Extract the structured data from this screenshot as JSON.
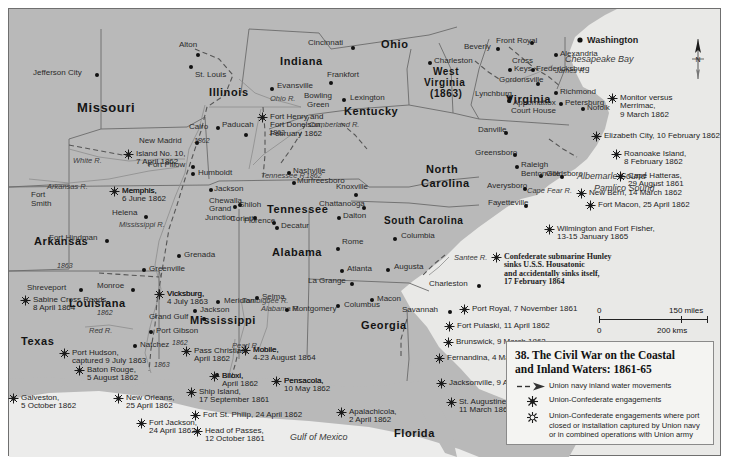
{
  "legend": {
    "title_line1": "38. The Civil War on the Coastal",
    "title_line2": "and Inland Waters: 1861-65",
    "items": [
      {
        "icon": "dashed-arrow-icon",
        "text": "Union navy inland water movements"
      },
      {
        "icon": "starburst-dark-icon",
        "text": "Union-Confederate engagements"
      },
      {
        "icon": "starburst-light-icon",
        "text": "Union-Confederate engagements where port closed or installation captured by Union navy or in combined operations with Union army"
      }
    ]
  },
  "scale": {
    "miles_zero": "0",
    "miles_max": "150 miles",
    "kms_zero": "0",
    "kms_max": "200 kms"
  },
  "compass": {
    "label": "N"
  },
  "states": [
    {
      "name": "Missouri",
      "x": 68,
      "y": 92,
      "size": "s13"
    },
    {
      "name": "Illinois",
      "x": 200,
      "y": 78,
      "size": "s11"
    },
    {
      "name": "Indiana",
      "x": 271,
      "y": 47,
      "size": "s11"
    },
    {
      "name": "Ohio",
      "x": 372,
      "y": 30,
      "size": "s11"
    },
    {
      "name": "Kentucky",
      "x": 335,
      "y": 97,
      "size": "s11"
    },
    {
      "name": "West",
      "x": 424,
      "y": 58,
      "size": "s10"
    },
    {
      "name": "Virginia",
      "x": 415,
      "y": 69,
      "size": "s10"
    },
    {
      "name": "(1863)",
      "x": 421,
      "y": 80,
      "size": "s10"
    },
    {
      "name": "Virginia",
      "x": 497,
      "y": 85,
      "size": "s11"
    },
    {
      "name": "Arkansas",
      "x": 25,
      "y": 227,
      "size": "s11"
    },
    {
      "name": "Tennessee",
      "x": 258,
      "y": 195,
      "size": "s11"
    },
    {
      "name": "North",
      "x": 417,
      "y": 155,
      "size": "s11"
    },
    {
      "name": "Carolina",
      "x": 412,
      "y": 169,
      "size": "s11"
    },
    {
      "name": "South Carolina",
      "x": 375,
      "y": 207,
      "size": "s10"
    },
    {
      "name": "Alabama",
      "x": 263,
      "y": 238,
      "size": "s11"
    },
    {
      "name": "Mississippi",
      "x": 181,
      "y": 306,
      "size": "s11"
    },
    {
      "name": "Louisiana",
      "x": 60,
      "y": 289,
      "size": "s11"
    },
    {
      "name": "Texas",
      "x": 12,
      "y": 327,
      "size": "s11"
    },
    {
      "name": "Georgia",
      "x": 352,
      "y": 311,
      "size": "s11"
    },
    {
      "name": "Florida",
      "x": 385,
      "y": 419,
      "size": "s11"
    }
  ],
  "waters": [
    {
      "name": "Gulf of Mexico",
      "x": 281,
      "y": 424
    },
    {
      "name": "Chesapeake Bay",
      "x": 556,
      "y": 46
    },
    {
      "name": "Albemarle Sound",
      "x": 568,
      "y": 163
    },
    {
      "name": "Pamlico Sound",
      "x": 585,
      "y": 175
    }
  ],
  "rivers": [
    {
      "name": "White R.",
      "x": 64,
      "y": 148
    },
    {
      "name": "Arkansas R.",
      "x": 38,
      "y": 174
    },
    {
      "name": "Mississippi R.",
      "x": 110,
      "y": 212
    },
    {
      "name": "Tennessee R.",
      "x": 252,
      "y": 163
    },
    {
      "name": "Cumberland R.",
      "x": 300,
      "y": 112
    },
    {
      "name": "Ohio R.",
      "x": 261,
      "y": 86
    },
    {
      "name": "James R.",
      "x": 546,
      "y": 58
    },
    {
      "name": "Santee R.",
      "x": 445,
      "y": 245
    },
    {
      "name": "Cape Fear R.",
      "x": 518,
      "y": 178
    },
    {
      "name": "Red R.",
      "x": 80,
      "y": 318
    },
    {
      "name": "Pearl R.",
      "x": 223,
      "y": 333
    },
    {
      "name": "Tombigbee R.",
      "x": 233,
      "y": 288
    },
    {
      "name": "Alabama R.",
      "x": 252,
      "y": 296
    }
  ],
  "year_marks": [
    {
      "name": "1862",
      "x": 185,
      "y": 128
    },
    {
      "name": "1862",
      "x": 260,
      "y": 120
    },
    {
      "name": "1862",
      "x": 297,
      "y": 163
    },
    {
      "name": "1863",
      "x": 48,
      "y": 253
    },
    {
      "name": "1862",
      "x": 163,
      "y": 330
    },
    {
      "name": "1862",
      "x": 88,
      "y": 300
    },
    {
      "name": "1863",
      "x": 145,
      "y": 352
    }
  ],
  "cities": [
    {
      "name": "Jefferson City",
      "x": 24,
      "y": 60,
      "dx": 62,
      "dy": 4
    },
    {
      "name": "Alton",
      "x": 170,
      "y": 32,
      "dx": 17,
      "dy": 12
    },
    {
      "name": "St. Louis",
      "x": 186,
      "y": 62,
      "dx": -6,
      "dy": -6
    },
    {
      "name": "Cairo",
      "x": 180,
      "y": 114,
      "dx": 27,
      "dy": 3
    },
    {
      "name": "Paducah",
      "x": 213,
      "y": 112,
      "dx": 22,
      "dy": 12
    },
    {
      "name": "Cincinnati",
      "x": 299,
      "y": 30,
      "dx": 43,
      "dy": 7
    },
    {
      "name": "Evansville",
      "x": 268,
      "y": 73,
      "dx": -7,
      "dy": 5
    },
    {
      "name": "Frankfort",
      "x": 318,
      "y": 62,
      "dx": 2,
      "dy": 10
    },
    {
      "name": "Lexington",
      "x": 341,
      "y": 85,
      "dx": -8,
      "dy": 4
    },
    {
      "name": "Bowling",
      "x": 295,
      "y": 83,
      "dx": 0,
      "dy": 0
    },
    {
      "name": "Green",
      "x": 298,
      "y": 92,
      "dx": 0,
      "dy": 0
    },
    {
      "name": "Charleston",
      "x": 425,
      "y": 48,
      "dx": -6,
      "dy": 4
    },
    {
      "name": "Beverly",
      "x": 455,
      "y": 34,
      "dx": 32,
      "dy": 4
    },
    {
      "name": "Front Royal",
      "x": 487,
      "y": 28,
      "dx": 34,
      "dy": 4
    },
    {
      "name": "Alexandria",
      "x": 551,
      "y": 41,
      "dx": -6,
      "dy": 3
    },
    {
      "name": "Cross",
      "x": 503,
      "y": 48,
      "dx": 0,
      "dy": 0
    },
    {
      "name": "Keys",
      "x": 505,
      "y": 56,
      "dx": -6,
      "dy": 3
    },
    {
      "name": "Fredericksburg",
      "x": 527,
      "y": 56,
      "dx": -5,
      "dy": 3
    },
    {
      "name": "Gordonsville",
      "x": 490,
      "y": 67,
      "dx": 37,
      "dy": 6
    },
    {
      "name": "Richmond",
      "x": 551,
      "y": 79,
      "dx": -6,
      "dy": 3
    },
    {
      "name": "Lynchburg",
      "x": 466,
      "y": 81,
      "dx": 33,
      "dy": 6
    },
    {
      "name": "Petersburg",
      "x": 556,
      "y": 90,
      "dx": -6,
      "dy": 3
    },
    {
      "name": "Appomattox",
      "x": 504,
      "y": 90,
      "dx": -6,
      "dy": 0
    },
    {
      "name": "Court House",
      "x": 502,
      "y": 98,
      "dx": 0,
      "dy": 0
    },
    {
      "name": "Nofolk",
      "x": 578,
      "y": 95,
      "dx": -6,
      "dy": 3
    },
    {
      "name": "Danville",
      "x": 469,
      "y": 117,
      "dx": 26,
      "dy": 5
    },
    {
      "name": "Greensboro",
      "x": 466,
      "y": 140,
      "dx": 38,
      "dy": 4
    },
    {
      "name": "Raleigh",
      "x": 512,
      "y": 152,
      "dx": -6,
      "dy": 4
    },
    {
      "name": "Goldsboro",
      "x": 537,
      "y": 161,
      "dx": -7,
      "dy": 4
    },
    {
      "name": "Bentonville",
      "x": 512,
      "y": 161,
      "dx": 39,
      "dy": 5
    },
    {
      "name": "Averysboro",
      "x": 478,
      "y": 173,
      "dx": 36,
      "dy": 5
    },
    {
      "name": "Fayetteville",
      "x": 479,
      "y": 190,
      "dx": 36,
      "dy": 5
    },
    {
      "name": "Knoxville",
      "x": 327,
      "y": 174,
      "dx": 18,
      "dy": 10
    },
    {
      "name": "Nashville",
      "x": 284,
      "y": 158,
      "dx": -6,
      "dy": 4
    },
    {
      "name": "Murfreesboro",
      "x": 288,
      "y": 168,
      "dx": -5,
      "dy": 4
    },
    {
      "name": "Chattanooga",
      "x": 310,
      "y": 191,
      "dx": 43,
      "dy": 6
    },
    {
      "name": "Dalton",
      "x": 334,
      "y": 203,
      "dx": -6,
      "dy": 4
    },
    {
      "name": "Decatur",
      "x": 272,
      "y": 213,
      "dx": -6,
      "dy": 4
    },
    {
      "name": "Florence",
      "x": 235,
      "y": 208,
      "dx": 28,
      "dy": 4
    },
    {
      "name": "Corinth",
      "x": 221,
      "y": 206,
      "dx": 23,
      "dy": 1
    },
    {
      "name": "Grand",
      "x": 200,
      "y": 196,
      "dx": 0,
      "dy": 0
    },
    {
      "name": "Junction",
      "x": 196,
      "y": 205,
      "dx": 0,
      "dy": 0
    },
    {
      "name": "Shiloh",
      "x": 230,
      "y": 192,
      "dx": -6,
      "dy": 4
    },
    {
      "name": "Chewalla",
      "x": 200,
      "y": 188,
      "dx": 29,
      "dy": 6
    },
    {
      "name": "Jackson",
      "x": 205,
      "y": 176,
      "dx": -5,
      "dy": 3
    },
    {
      "name": "Humboldt",
      "x": 189,
      "y": 160,
      "dx": -7,
      "dy": 3
    },
    {
      "name": "Fort Pillow",
      "x": 139,
      "y": 152,
      "dx": 43,
      "dy": 4
    },
    {
      "name": "Helena",
      "x": 103,
      "y": 200,
      "dx": 32,
      "dy": 6
    },
    {
      "name": "Fort Hindman",
      "x": 40,
      "y": 225,
      "dx": 56,
      "dy": 5
    },
    {
      "name": "Grenada",
      "x": 175,
      "y": 242,
      "dx": -7,
      "dy": 3
    },
    {
      "name": "Greenville",
      "x": 140,
      "y": 256,
      "dx": -7,
      "dy": 3
    },
    {
      "name": "Fort",
      "x": 22,
      "y": 182,
      "dx": 0,
      "dy": 0
    },
    {
      "name": "Smith",
      "x": 22,
      "y": 191,
      "dx": 0,
      "dy": 0
    },
    {
      "name": "Shreveport",
      "x": 18,
      "y": 275,
      "dx": 52,
      "dy": 4
    },
    {
      "name": "Monroe",
      "x": 88,
      "y": 273,
      "dx": 34,
      "dy": 6
    },
    {
      "name": "Grand Gulf",
      "x": 140,
      "y": 304,
      "dx": 53,
      "dy": 4
    },
    {
      "name": "Port Gibson",
      "x": 147,
      "y": 318,
      "dx": -7,
      "dy": 3
    },
    {
      "name": "Natchez",
      "x": 131,
      "y": 332,
      "dx": -7,
      "dy": 3
    },
    {
      "name": "Jackson",
      "x": 191,
      "y": 297,
      "dx": -7,
      "dy": 3
    },
    {
      "name": "Meridian",
      "x": 215,
      "y": 288,
      "dx": -8,
      "dy": 3
    },
    {
      "name": "Selma",
      "x": 253,
      "y": 284,
      "dx": -7,
      "dy": 3
    },
    {
      "name": "Montgomery",
      "x": 283,
      "y": 296,
      "dx": -7,
      "dy": 3
    },
    {
      "name": "Columbus",
      "x": 335,
      "y": 292,
      "dx": -8,
      "dy": 3
    },
    {
      "name": "La Grange",
      "x": 299,
      "y": 268,
      "dx": 42,
      "dy": 5
    },
    {
      "name": "Atlanta",
      "x": 338,
      "y": 256,
      "dx": -7,
      "dy": 4
    },
    {
      "name": "Rome",
      "x": 333,
      "y": 229,
      "dx": -6,
      "dy": 9
    },
    {
      "name": "Macon",
      "x": 368,
      "y": 286,
      "dx": -7,
      "dy": 3
    },
    {
      "name": "Augusta",
      "x": 385,
      "y": 254,
      "dx": -8,
      "dy": 5
    },
    {
      "name": "Columbia",
      "x": 392,
      "y": 223,
      "dx": -8,
      "dy": 5
    },
    {
      "name": "Charleston",
      "x": 420,
      "y": 271,
      "dx": 48,
      "dy": 4
    },
    {
      "name": "Savannah",
      "x": 393,
      "y": 297,
      "dx": 46,
      "dy": 4
    },
    {
      "name": "New Madrid",
      "x": 130,
      "y": 128,
      "dx": 56,
      "dy": 4
    },
    {
      "name": "Memphis,",
      "x": 113,
      "y": 178,
      "dx": 0,
      "dy": 0
    },
    {
      "name": "Vicksburg,",
      "x": 158,
      "y": 281,
      "dx": 0,
      "dy": 0
    },
    {
      "name": "Mobile,",
      "x": 244,
      "y": 337,
      "dx": 0,
      "dy": 0
    },
    {
      "name": "Biloxi,",
      "x": 213,
      "y": 363,
      "dx": -7,
      "dy": 1
    },
    {
      "name": "Pensacola,",
      "x": 275,
      "y": 368,
      "dx": 0,
      "dy": 0
    }
  ],
  "events": [
    {
      "lines": [
        "Washington"
      ],
      "x": 578,
      "y": 27,
      "kind": "capital"
    },
    {
      "lines": [
        "Monitor versus",
        "Merrimac,",
        "9 March 1862"
      ],
      "x": 611,
      "y": 85
    },
    {
      "lines": [
        "Elizabeth City, 10 February 1862"
      ],
      "x": 595,
      "y": 123
    },
    {
      "lines": [
        "Roanoake Island,",
        "8 February 1862"
      ],
      "x": 615,
      "y": 141
    },
    {
      "lines": [
        "Cape Hatteras,",
        "29 August 1861"
      ],
      "x": 619,
      "y": 163
    },
    {
      "lines": [
        "New Bern, 14 March 1862"
      ],
      "x": 580,
      "y": 180
    },
    {
      "lines": [
        "Fort Macon, 25 April 1862"
      ],
      "x": 589,
      "y": 192
    },
    {
      "lines": [
        "Wilmington and Fort Fisher,",
        "13-15 January 1865"
      ],
      "x": 548,
      "y": 216
    },
    {
      "lines": [
        "Confederate submarine Hunley",
        "sinks U.S.S. Housatonic",
        "and accidentally sinks itself,",
        "17 February 1864"
      ],
      "x": 495,
      "y": 244,
      "serif": true
    },
    {
      "lines": [
        "Port Royal, 7 November 1861"
      ],
      "x": 463,
      "y": 296
    },
    {
      "lines": [
        "Fort Pulaski, 11 April 1862"
      ],
      "x": 448,
      "y": 313
    },
    {
      "lines": [
        "Brunswick, 9 March 1862"
      ],
      "x": 447,
      "y": 329
    },
    {
      "lines": [
        "Fernandina, 4 March 1862"
      ],
      "x": 438,
      "y": 345
    },
    {
      "lines": [
        "Jacksonville, 9 April 1862"
      ],
      "x": 440,
      "y": 370
    },
    {
      "lines": [
        "St. Augustine,",
        "11 March 1862"
      ],
      "x": 450,
      "y": 389
    },
    {
      "lines": [
        "Apalachicola,",
        "2 April 1862"
      ],
      "x": 340,
      "y": 399
    },
    {
      "lines": [
        "Pensacola,",
        "10 May 1862"
      ],
      "x": 275,
      "y": 368
    },
    {
      "lines": [
        "Mobile,",
        "4-23 August 1864"
      ],
      "x": 244,
      "y": 337
    },
    {
      "lines": [
        "Biloxi,",
        "April 1862"
      ],
      "x": 213,
      "y": 363
    },
    {
      "lines": [
        "Pass Christian,",
        "April 1862"
      ],
      "x": 185,
      "y": 338
    },
    {
      "lines": [
        "Ship Island,",
        "17 September 1861"
      ],
      "x": 190,
      "y": 379
    },
    {
      "lines": [
        "Fort St. Philip, 24 April 1862"
      ],
      "x": 194,
      "y": 402
    },
    {
      "lines": [
        "Head of Passes,",
        "12 October 1861"
      ],
      "x": 196,
      "y": 418
    },
    {
      "lines": [
        "Fort Jackson,",
        "24 April 1862"
      ],
      "x": 140,
      "y": 410
    },
    {
      "lines": [
        "New Orleans,",
        "25 April 1862"
      ],
      "x": 117,
      "y": 385
    },
    {
      "lines": [
        "Galveston,",
        "5 October 1862"
      ],
      "x": 12,
      "y": 385
    },
    {
      "lines": [
        "Baton Rouge,",
        "5 August 1862"
      ],
      "x": 78,
      "y": 357
    },
    {
      "lines": [
        "Port Hudson,",
        "captured 9 July 1863"
      ],
      "x": 63,
      "y": 340
    },
    {
      "lines": [
        "Sabine Cross Roads,",
        "8 April 1864"
      ],
      "x": 24,
      "y": 287
    },
    {
      "lines": [
        "Vicksburg,",
        "4 July 1863"
      ],
      "x": 158,
      "y": 281
    },
    {
      "lines": [
        "Memphis,",
        "6 June 1862"
      ],
      "x": 113,
      "y": 178
    },
    {
      "lines": [
        "Island No. 10,",
        "7 April 1862"
      ],
      "x": 127,
      "y": 141
    },
    {
      "lines": [
        "Fort Henry and",
        "Fort Donelson,",
        "February 1862"
      ],
      "x": 261,
      "y": 104
    }
  ]
}
